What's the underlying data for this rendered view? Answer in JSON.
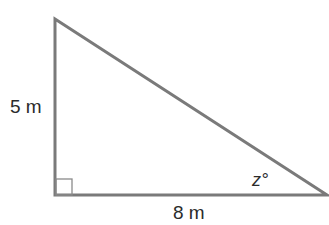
{
  "diagram": {
    "type": "right-triangle",
    "stroke_color": "#7a7a7a",
    "label_color": "#2b2b2b",
    "vertices": {
      "top": [
        55,
        19
      ],
      "right_angle": [
        55,
        195
      ],
      "right": [
        327,
        195
      ]
    },
    "labels": {
      "vertical_side": "5 m",
      "horizontal_side": "8 m",
      "angle": "z°"
    },
    "right_angle_marker": true
  }
}
